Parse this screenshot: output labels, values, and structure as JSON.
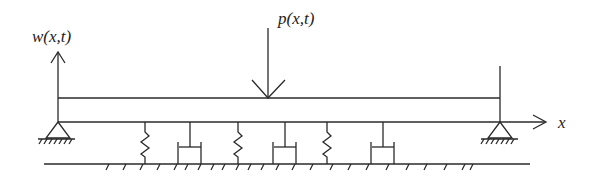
{
  "diagram": {
    "labels": {
      "deflection": "w(x,t)",
      "load": "p(x,t)",
      "axis": "x"
    },
    "colors": {
      "stroke": "#2a2a2a",
      "background": "#ffffff"
    },
    "beam": {
      "left": 58,
      "right": 500,
      "top": 98,
      "bottom": 122
    },
    "springs_x": [
      145,
      238,
      327
    ],
    "dampers_x": [
      190,
      285,
      380
    ]
  }
}
